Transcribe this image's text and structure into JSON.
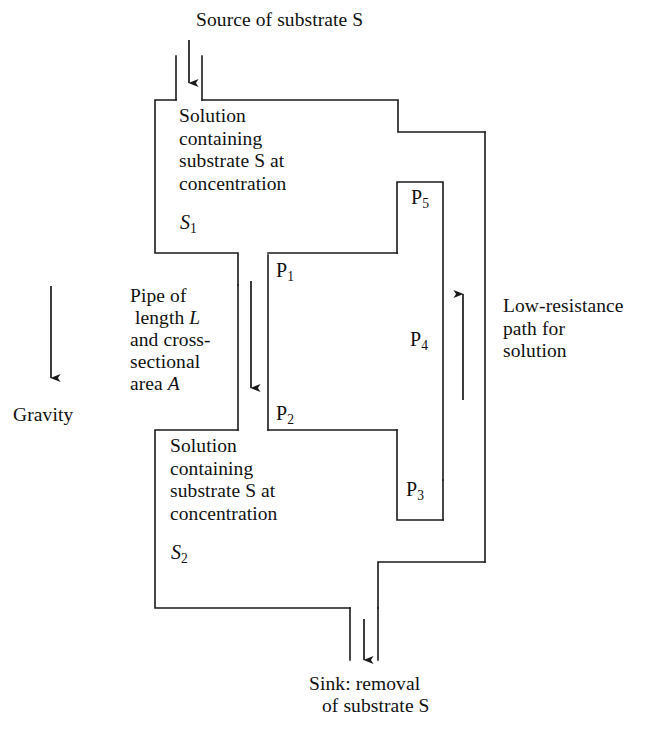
{
  "figure": {
    "line_color": "#1a1a1a",
    "background_color": "#ffffff",
    "text_color": "#111111"
  },
  "labels": {
    "source": "Source of substrate S",
    "sink_line1": "Sink: removal",
    "sink_line2": "of substrate S",
    "upper_chamber": "Solution\ncontaining\nsubstrate S at\nconcentration",
    "lower_chamber": "Solution\ncontaining\nsubstrate S at\nconcentration",
    "pipe_description": "Pipe of\nlength\nand cross-\nsectional\narea",
    "pipe_line1": "Pipe of",
    "pipe_line2_pre": "length ",
    "pipe_line2_var": "L",
    "pipe_line3": "and cross-",
    "pipe_line4": "sectional",
    "pipe_line5_pre": "area ",
    "pipe_line5_var": "A",
    "gravity": "Gravity",
    "low_resistance": "Low-resistance\npath for\nsolution"
  },
  "concentrations": {
    "upper": {
      "base": "S",
      "subscript": "1"
    },
    "lower": {
      "base": "S",
      "subscript": "2"
    }
  },
  "pressure_points": [
    {
      "id": "p1",
      "base": "P",
      "subscript": "1"
    },
    {
      "id": "p2",
      "base": "P",
      "subscript": "2"
    },
    {
      "id": "p3",
      "base": "P",
      "subscript": "3"
    },
    {
      "id": "p4",
      "base": "P",
      "subscript": "4"
    },
    {
      "id": "p5",
      "base": "P",
      "subscript": "5"
    }
  ],
  "arrows": [
    {
      "name": "inlet-flow-arrow",
      "direction": "down"
    },
    {
      "name": "pipe-flow-arrow",
      "direction": "down"
    },
    {
      "name": "return-flow-arrow",
      "direction": "up"
    },
    {
      "name": "gravity-arrow",
      "direction": "down"
    },
    {
      "name": "outlet-flow-arrow",
      "direction": "down"
    }
  ]
}
